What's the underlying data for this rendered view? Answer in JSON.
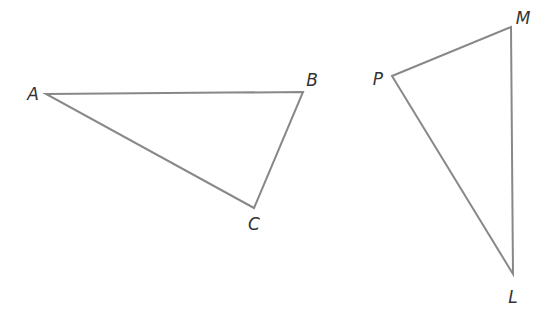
{
  "diagram": {
    "stroke_color": "#888888",
    "label_color": "#333333",
    "triangles": [
      {
        "name": "ABC",
        "vertices": [
          {
            "label": "A",
            "x": 46,
            "y": 94,
            "lx": 33,
            "ly": 94
          },
          {
            "label": "B",
            "x": 303,
            "y": 92,
            "lx": 312,
            "ly": 80
          },
          {
            "label": "C",
            "x": 254,
            "y": 208,
            "lx": 254,
            "ly": 224
          }
        ]
      },
      {
        "name": "PML",
        "vertices": [
          {
            "label": "P",
            "x": 392,
            "y": 76,
            "lx": 378,
            "ly": 79
          },
          {
            "label": "M",
            "x": 511,
            "y": 27,
            "lx": 523,
            "ly": 18
          },
          {
            "label": "L",
            "x": 513,
            "y": 274,
            "lx": 513,
            "ly": 297
          }
        ]
      }
    ]
  }
}
